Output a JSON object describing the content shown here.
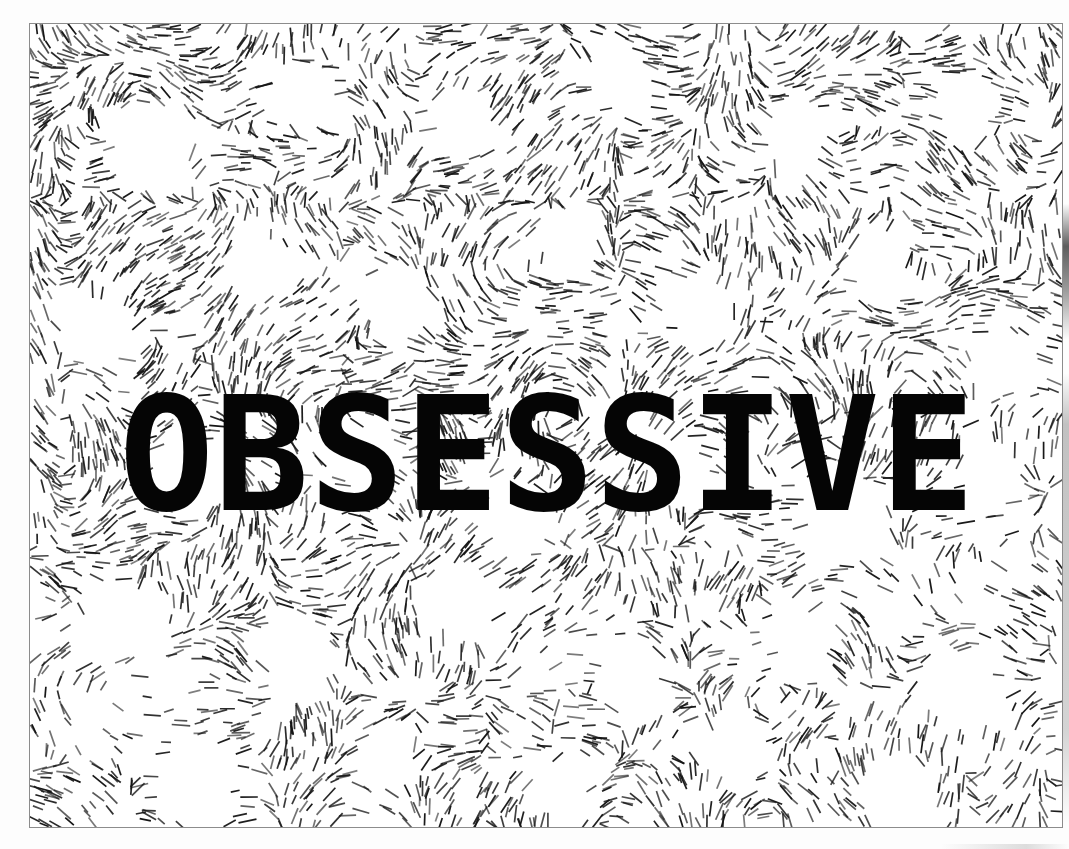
{
  "artwork": {
    "title": "OBSESSIVE",
    "headline_text": "OBSESSIVE",
    "medium": "hatched flow-field print",
    "canvas": {
      "width": 1069,
      "height": 849
    },
    "palette": {
      "background": "#ffffff",
      "paper": "#fdfdfd",
      "ink": "#151515",
      "headline_ink": "#050505",
      "frame_line": "#8c8c8c"
    },
    "frame": {
      "x": 29,
      "y": 23,
      "width": 1034,
      "height": 805,
      "stroke_width": 1
    },
    "headline": {
      "text": "OBSESSIVE",
      "character_count": 9,
      "font_size_px": 158,
      "weight": "bold",
      "cap_height_px": 115,
      "baseline_y": 490,
      "left_x": 110,
      "right_x": 1000,
      "color": "#050505"
    },
    "texture": {
      "kind": "flow-field-hatching",
      "stroke_count": 7200,
      "stroke_length_min": 9,
      "stroke_length_max": 19,
      "stroke_width": 1.7,
      "ink": "#151515",
      "void_description": "circular white voids between hatch clusters",
      "density_note": "denser upper-left and center-left, sparser lower-right and bottom-left",
      "voids": [
        {
          "cx": 150,
          "cy": 150,
          "r": 66
        },
        {
          "cx": 300,
          "cy": 95,
          "r": 52
        },
        {
          "cx": 455,
          "cy": 120,
          "r": 46
        },
        {
          "cx": 620,
          "cy": 80,
          "r": 44
        },
        {
          "cx": 790,
          "cy": 140,
          "r": 50
        },
        {
          "cx": 960,
          "cy": 105,
          "r": 44
        },
        {
          "cx": 100,
          "cy": 330,
          "r": 58
        },
        {
          "cx": 255,
          "cy": 265,
          "r": 48
        },
        {
          "cx": 400,
          "cy": 300,
          "r": 52
        },
        {
          "cx": 560,
          "cy": 240,
          "r": 44
        },
        {
          "cx": 700,
          "cy": 310,
          "r": 50
        },
        {
          "cx": 880,
          "cy": 270,
          "r": 46
        },
        {
          "cx": 1010,
          "cy": 360,
          "r": 48
        },
        {
          "cx": 190,
          "cy": 470,
          "r": 54
        },
        {
          "cx": 360,
          "cy": 455,
          "r": 44
        },
        {
          "cx": 520,
          "cy": 520,
          "r": 50
        },
        {
          "cx": 680,
          "cy": 470,
          "r": 46
        },
        {
          "cx": 845,
          "cy": 515,
          "r": 58
        },
        {
          "cx": 990,
          "cy": 480,
          "r": 50
        },
        {
          "cx": 120,
          "cy": 620,
          "r": 62
        },
        {
          "cx": 290,
          "cy": 650,
          "r": 50
        },
        {
          "cx": 460,
          "cy": 610,
          "r": 54
        },
        {
          "cx": 630,
          "cy": 680,
          "r": 48
        },
        {
          "cx": 800,
          "cy": 640,
          "r": 52
        },
        {
          "cx": 960,
          "cy": 690,
          "r": 56
        },
        {
          "cx": 200,
          "cy": 780,
          "r": 58
        },
        {
          "cx": 390,
          "cy": 760,
          "r": 46
        },
        {
          "cx": 560,
          "cy": 790,
          "r": 50
        },
        {
          "cx": 730,
          "cy": 745,
          "r": 48
        },
        {
          "cx": 900,
          "cy": 795,
          "r": 52
        }
      ],
      "sparse_zones": [
        {
          "cx": 120,
          "cy": 700,
          "r": 130,
          "falloff": 0.8
        },
        {
          "cx": 940,
          "cy": 560,
          "r": 120,
          "falloff": 0.7
        },
        {
          "cx": 560,
          "cy": 640,
          "r": 90,
          "falloff": 0.55
        }
      ]
    },
    "scan_artifacts": {
      "right_edge_label": "scanner-edge-strip-right",
      "bottom_edge_label": "scanner-edge-strip-bottom"
    }
  }
}
